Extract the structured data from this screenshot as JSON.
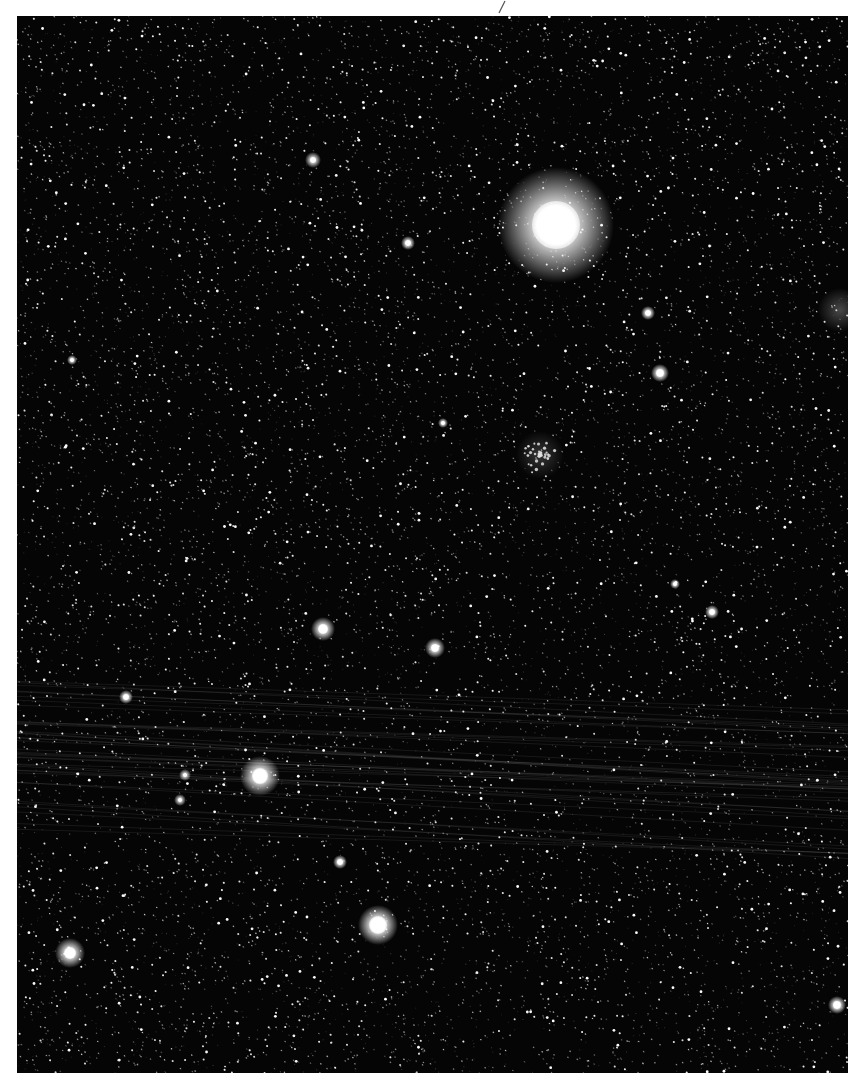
{
  "image": {
    "subject": "star field photograph",
    "background_color": "#050505",
    "frame": {
      "x": 17,
      "y": 16,
      "width": 831,
      "height": 1057
    },
    "star_density": 9000,
    "bright_stars": [
      {
        "x": 556,
        "y": 225,
        "core": 24,
        "halo": 58,
        "label": "brightest-star"
      },
      {
        "x": 260,
        "y": 776,
        "core": 8,
        "halo": 20,
        "label": "bright-star"
      },
      {
        "x": 378,
        "y": 925,
        "core": 9,
        "halo": 20,
        "label": "bright-star"
      },
      {
        "x": 70,
        "y": 953,
        "core": 6,
        "halo": 15,
        "label": "bright-star"
      },
      {
        "x": 323,
        "y": 629,
        "core": 5,
        "halo": 12,
        "label": "bright-star"
      },
      {
        "x": 435,
        "y": 648,
        "core": 4,
        "halo": 10,
        "label": "bright-star"
      },
      {
        "x": 660,
        "y": 373,
        "core": 4,
        "halo": 9,
        "label": "bright-star"
      },
      {
        "x": 648,
        "y": 313,
        "core": 3,
        "halo": 7,
        "label": "bright-star"
      },
      {
        "x": 712,
        "y": 612,
        "core": 3,
        "halo": 7,
        "label": "bright-star"
      },
      {
        "x": 313,
        "y": 160,
        "core": 3,
        "halo": 8,
        "label": "bright-star"
      },
      {
        "x": 408,
        "y": 243,
        "core": 3,
        "halo": 7,
        "label": "bright-star"
      },
      {
        "x": 837,
        "y": 1005,
        "core": 4,
        "halo": 9,
        "label": "bright-star"
      },
      {
        "x": 340,
        "y": 862,
        "core": 3,
        "halo": 7,
        "label": "bright-star"
      },
      {
        "x": 126,
        "y": 697,
        "core": 3,
        "halo": 7,
        "label": "bright-star"
      },
      {
        "x": 185,
        "y": 775,
        "core": 2,
        "halo": 6,
        "label": "bright-star"
      },
      {
        "x": 180,
        "y": 800,
        "core": 2,
        "halo": 6,
        "label": "bright-star"
      },
      {
        "x": 72,
        "y": 360,
        "core": 2,
        "halo": 5,
        "label": "bright-star"
      },
      {
        "x": 443,
        "y": 423,
        "core": 2,
        "halo": 5,
        "label": "bright-star"
      },
      {
        "x": 675,
        "y": 584,
        "core": 2,
        "halo": 5,
        "label": "bright-star"
      }
    ],
    "star_cluster": {
      "x": 540,
      "y": 455,
      "radius": 16,
      "count": 40
    },
    "edge_glow": {
      "x": 840,
      "y": 310,
      "radius": 22
    },
    "satellite_trails": {
      "y_start": 700,
      "y_end": 855,
      "count": 38,
      "slope": 0.045,
      "color": "rgba(200,200,200,0.10)"
    }
  },
  "top_mark": {
    "x": 500,
    "y": 5,
    "description": "small pen stroke"
  }
}
